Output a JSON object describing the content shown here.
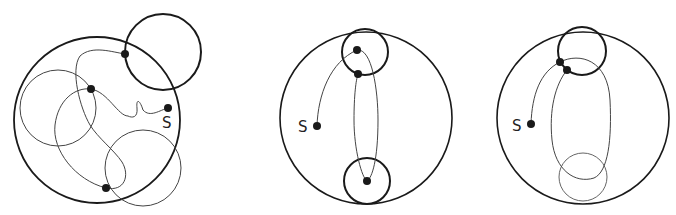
{
  "figure": {
    "panels": [
      {
        "id": "panel-1",
        "start_label": "S",
        "outer_circle": {
          "cx": 97,
          "cy": 120,
          "r": 83
        },
        "small_circles": [
          {
            "cx": 163,
            "cy": 52,
            "r": 38,
            "weight": "thick"
          },
          {
            "cx": 58,
            "cy": 108,
            "r": 38,
            "weight": "thin"
          },
          {
            "cx": 143,
            "cy": 168,
            "r": 38,
            "weight": "thin"
          }
        ],
        "points": [
          {
            "x": 168,
            "y": 108,
            "role": "start"
          },
          {
            "x": 91,
            "y": 89
          },
          {
            "x": 125,
            "y": 54
          },
          {
            "x": 106,
            "y": 188
          }
        ]
      },
      {
        "id": "panel-2",
        "start_label": "S",
        "outer_circle": {
          "cx": 366,
          "cy": 118,
          "r": 86
        },
        "small_circles": [
          {
            "cx": 365,
            "cy": 52,
            "r": 23,
            "weight": "thick"
          },
          {
            "cx": 367,
            "cy": 181,
            "r": 23,
            "weight": "thick"
          }
        ],
        "points": [
          {
            "x": 317,
            "y": 126,
            "role": "start"
          },
          {
            "x": 357,
            "y": 50
          },
          {
            "x": 358,
            "y": 74
          },
          {
            "x": 367,
            "y": 181
          }
        ]
      },
      {
        "id": "panel-3",
        "start_label": "S",
        "outer_circle": {
          "cx": 583,
          "cy": 118,
          "r": 86
        },
        "small_circles": [
          {
            "cx": 582,
            "cy": 51,
            "r": 24,
            "weight": "thick"
          },
          {
            "cx": 583,
            "cy": 177,
            "r": 24,
            "weight": "thin"
          }
        ],
        "points": [
          {
            "x": 531,
            "y": 124,
            "role": "start"
          },
          {
            "x": 560,
            "y": 62
          },
          {
            "x": 567,
            "y": 70
          }
        ]
      }
    ],
    "colors": {
      "ink": "#1a1a1a",
      "thin_ink": "#555555",
      "background": "#ffffff"
    }
  }
}
